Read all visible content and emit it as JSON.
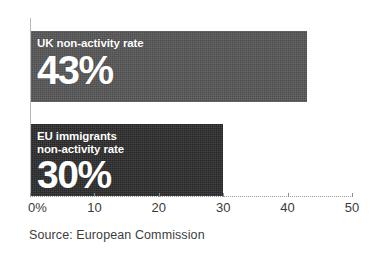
{
  "chart_data": {
    "type": "bar",
    "orientation": "horizontal",
    "title": "",
    "xlabel": "",
    "ylabel": "",
    "xlim": [
      0,
      50
    ],
    "grid": false,
    "legend": null,
    "categories": [
      "UK non-activity rate",
      "EU immigrants non-activity rate"
    ],
    "values": [
      43,
      30
    ],
    "bars": [
      {
        "label_lines": [
          "UK non-activity rate"
        ],
        "value": 43,
        "value_label": "43%",
        "color": "#565656"
      },
      {
        "label_lines": [
          "EU immigrants",
          "non-activity rate"
        ],
        "value": 30,
        "value_label": "30%",
        "color": "#2b2b2b"
      }
    ],
    "x_ticks": [
      {
        "value": 0,
        "label": "0%"
      },
      {
        "value": 10,
        "label": "10"
      },
      {
        "value": 20,
        "label": "20"
      },
      {
        "value": 30,
        "label": "30"
      },
      {
        "value": 40,
        "label": "40"
      },
      {
        "value": 50,
        "label": "50"
      }
    ],
    "source": "Source: European Commission"
  }
}
